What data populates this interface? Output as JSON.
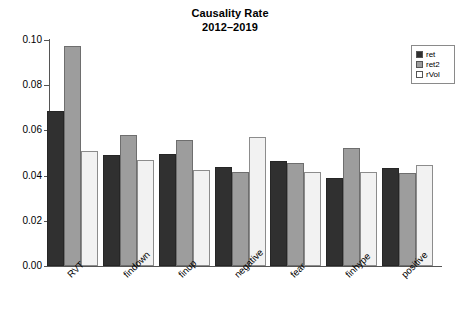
{
  "chart_data": {
    "type": "bar",
    "title": "Causality Rate",
    "subtitle": "2012–2019",
    "xlabel": "",
    "ylabel": "",
    "ylim": [
      0.0,
      0.1
    ],
    "ytick_labels": [
      "0.10",
      "0.08",
      "0.06",
      "0.04",
      "0.02",
      "0.00"
    ],
    "ytick_values": [
      0.1,
      0.08,
      0.06,
      0.04,
      0.02,
      0.0
    ],
    "grid": false,
    "legend_position": "top-right",
    "categories": [
      "RVT",
      "findown",
      "finup",
      "negative",
      "fear",
      "finhype",
      "positive"
    ],
    "series": [
      {
        "name": "ret",
        "color": "#303030",
        "values": [
          0.0685,
          0.0492,
          0.0495,
          0.0437,
          0.0466,
          0.039,
          0.0434
        ]
      },
      {
        "name": "ret2",
        "color": "#9d9d9d",
        "values": [
          0.0975,
          0.0578,
          0.0558,
          0.0417,
          0.0455,
          0.0521,
          0.0412
        ]
      },
      {
        "name": "rVol",
        "color": "#f2f2f2",
        "values": [
          0.051,
          0.047,
          0.0427,
          0.0572,
          0.0416,
          0.0417,
          0.0445
        ]
      }
    ],
    "legend": [
      {
        "label": "ret",
        "swatch": "#303030"
      },
      {
        "label": "ret2",
        "swatch": "#9d9d9d"
      },
      {
        "label": "rVol",
        "swatch": "#ffffff"
      }
    ]
  }
}
